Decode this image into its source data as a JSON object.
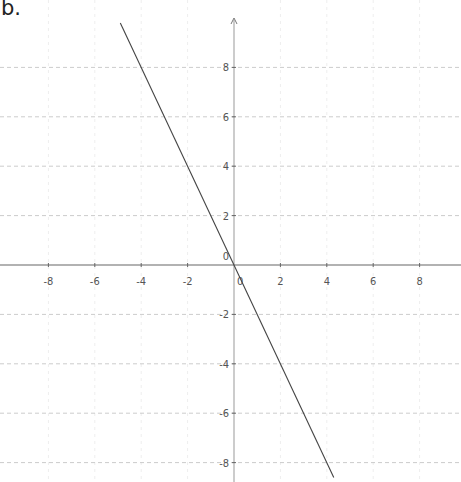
{
  "figure_label": "b.",
  "chart_data": {
    "type": "line",
    "title": "",
    "xlabel": "",
    "ylabel": "",
    "xlim": [
      -10,
      9.8
    ],
    "ylim": [
      -8.9,
      10
    ],
    "grid": true,
    "x_ticks": [
      -8,
      -6,
      -4,
      -2,
      2,
      4,
      6,
      8
    ],
    "y_ticks": [
      8,
      6,
      4,
      2,
      -2,
      -4,
      -6,
      -8
    ],
    "origin_label": "0",
    "series": [
      {
        "name": "y = -2x",
        "equation": "y = -2x",
        "slope": -2,
        "intercept": 0,
        "x": [
          -4.9,
          4.3
        ],
        "values": [
          9.8,
          -8.6
        ],
        "color": "#444444"
      }
    ]
  },
  "layout": {
    "origin_px": [
      234,
      265
    ],
    "px_per_unit_x": 23.2,
    "px_per_unit_y": 24.7
  },
  "colors": {
    "axis": "#666666",
    "grid": "#cccccc",
    "line": "#444444",
    "text": "#555555"
  }
}
